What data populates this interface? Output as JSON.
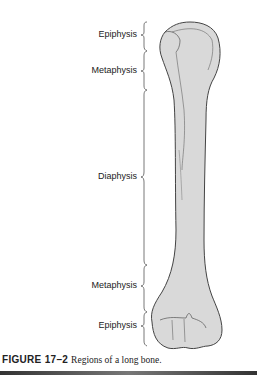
{
  "diagram": {
    "subject": "long bone",
    "labels": [
      {
        "id": "epiphysis-top",
        "text": "Epiphysis"
      },
      {
        "id": "metaphysis-top",
        "text": "Metaphysis"
      },
      {
        "id": "diaphysis",
        "text": "Diaphysis"
      },
      {
        "id": "metaphysis-bottom",
        "text": "Metaphysis"
      },
      {
        "id": "epiphysis-bottom",
        "text": "Epiphysis"
      }
    ],
    "colors": {
      "bone_fill": "#d9d9d9",
      "outline": "#444444",
      "text": "#222222"
    }
  },
  "caption": {
    "figure_number": "FIGURE 17–2",
    "text": "Regions of a long bone."
  }
}
